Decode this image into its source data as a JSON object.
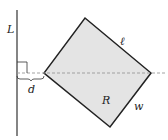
{
  "labels": {
    "L": "L",
    "ell": "ℓ",
    "R": "R",
    "w": "w",
    "d": "d"
  },
  "colors": {
    "fill": "#e4e4e4",
    "stroke": "#222222",
    "dash": "#999999"
  }
}
